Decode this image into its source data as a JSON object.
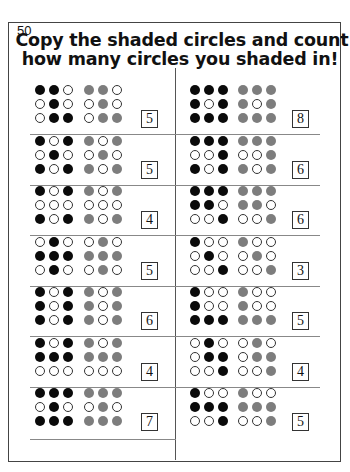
{
  "page_number": "50",
  "title": {
    "line1": "Copy the shaded circles and count",
    "line2": "how many circles you shaded in!"
  },
  "colors": {
    "black_circle": "#0a0a0a",
    "gray_circle": "#7d7d7d",
    "empty_circle_border": "#333333"
  },
  "legend": {
    "B": "filled black circle",
    "O": "empty circle",
    "G": "filled gray circle (copy)"
  },
  "exercises": {
    "left": [
      {
        "pattern": [
          "BBO",
          "OBO",
          "OBB"
        ],
        "answer": "5"
      },
      {
        "pattern": [
          "BOB",
          "OBO",
          "BOB"
        ],
        "answer": "5"
      },
      {
        "pattern": [
          "BOB",
          "OOO",
          "BOB"
        ],
        "answer": "4"
      },
      {
        "pattern": [
          "OBO",
          "BBB",
          "OBO"
        ],
        "answer": "5"
      },
      {
        "pattern": [
          "BOB",
          "BOB",
          "BOB"
        ],
        "answer": "6"
      },
      {
        "pattern": [
          "BOB",
          "BBB",
          "OOO"
        ],
        "answer": "4"
      },
      {
        "pattern": [
          "BBB",
          "OBO",
          "BBB"
        ],
        "answer": "7"
      }
    ],
    "right": [
      {
        "pattern": [
          "BBB",
          "BOB",
          "BBB"
        ],
        "answer": "8"
      },
      {
        "pattern": [
          "BBB",
          "OOB",
          "BOB"
        ],
        "answer": "6"
      },
      {
        "pattern": [
          "BBB",
          "BBO",
          "OOB"
        ],
        "answer": "6"
      },
      {
        "pattern": [
          "BOO",
          "OBO",
          "OOB"
        ],
        "answer": "3"
      },
      {
        "pattern": [
          "BOO",
          "BOO",
          "BBB"
        ],
        "answer": "5"
      },
      {
        "pattern": [
          "OBO",
          "OBB",
          "OOB"
        ],
        "answer": "4"
      },
      {
        "pattern": [
          "BOO",
          "BBB",
          "OOB"
        ],
        "answer": "5"
      }
    ]
  }
}
